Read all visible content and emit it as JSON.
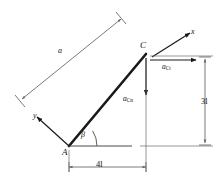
{
  "figure": {
    "type": "kinematics-free-body-diagram",
    "colors": {
      "rod": "#1a1a1a",
      "dimension_line": "#6b6b6b",
      "vector": "#1a1a1a",
      "background": "#ffffff"
    }
  },
  "points": {
    "A": "A",
    "C": "C"
  },
  "angles": {
    "beta": "β"
  },
  "axes": {
    "x_label": "x",
    "y_label": "y"
  },
  "vectors": {
    "tangential": {
      "symbol": "a",
      "subscript": "Ct"
    },
    "normal": {
      "symbol": "a",
      "subscript": "Cn"
    }
  },
  "dimensions": {
    "rod_length": "a",
    "horizontal": "4l",
    "vertical": "3l"
  }
}
